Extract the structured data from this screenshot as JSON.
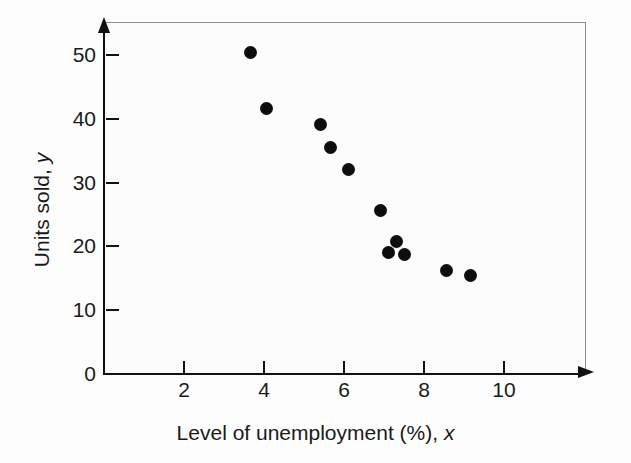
{
  "chart_data": {
    "type": "scatter",
    "title": "",
    "xlabel_main": "Level of unemployment (%),",
    "xlabel_symbol": "x",
    "ylabel_main": "Units sold,",
    "ylabel_symbol": "y",
    "xlim": [
      0,
      11.4
    ],
    "ylim": [
      0,
      55
    ],
    "grid": false,
    "legend": null,
    "xticks": [
      2,
      4,
      6,
      8,
      10
    ],
    "xtick_labels": [
      "2",
      "4",
      "6",
      "8",
      "10"
    ],
    "yticks": [
      0,
      10,
      20,
      30,
      40,
      50
    ],
    "ytick_labels": [
      "0",
      "10",
      "20",
      "30",
      "40",
      "50"
    ],
    "marker": "filled-circle",
    "marker_color": "#0d0d0d",
    "points": [
      {
        "x": 3.65,
        "y": 50.4
      },
      {
        "x": 4.05,
        "y": 41.6
      },
      {
        "x": 5.4,
        "y": 39.1
      },
      {
        "x": 5.65,
        "y": 35.5
      },
      {
        "x": 6.1,
        "y": 32.0
      },
      {
        "x": 6.9,
        "y": 25.6
      },
      {
        "x": 7.3,
        "y": 20.8
      },
      {
        "x": 7.1,
        "y": 19.1
      },
      {
        "x": 7.5,
        "y": 18.8
      },
      {
        "x": 8.55,
        "y": 16.2
      },
      {
        "x": 9.15,
        "y": 15.5
      }
    ]
  },
  "style": {
    "axis_color": "#111111",
    "frame_color": "#8d8d8d",
    "background": "#fdfdfd",
    "text_color": "#1a1a1a"
  }
}
